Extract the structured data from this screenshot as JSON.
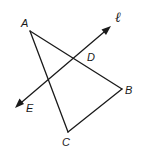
{
  "diagram": {
    "type": "geometry",
    "points": {
      "A": {
        "label": "A",
        "x": 30,
        "y": 31,
        "label_x": 21,
        "label_y": 27
      },
      "B": {
        "label": "B",
        "x": 122,
        "y": 89,
        "label_x": 125,
        "label_y": 94
      },
      "C": {
        "label": "C",
        "x": 68,
        "y": 132,
        "label_x": 62,
        "label_y": 146
      },
      "D": {
        "label": "D",
        "x": 73,
        "y": 59,
        "label_x": 87,
        "label_y": 61
      },
      "E": {
        "label": "E",
        "label_x": 26,
        "label_y": 112
      }
    },
    "line": {
      "label": "ℓ",
      "start": {
        "x": 15,
        "y": 108
      },
      "end": {
        "x": 111,
        "y": 26
      },
      "label_x": 115,
      "label_y": 22,
      "arrows": "both"
    },
    "segments": [
      {
        "from": "A",
        "to": "B"
      },
      {
        "from": "A",
        "to": "C"
      },
      {
        "from": "C",
        "to": "B"
      }
    ],
    "colors": {
      "stroke": "#1a1a1a",
      "background": "#ffffff"
    }
  }
}
